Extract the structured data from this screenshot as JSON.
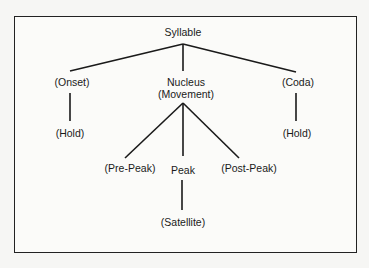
{
  "diagram": {
    "type": "tree",
    "root": "Syllable",
    "nodes": {
      "syllable": "Syllable",
      "onset": "(Onset)",
      "onset_hold": "(Hold)",
      "nucleus_line1": "Nucleus",
      "nucleus_line2": "(Movement)",
      "coda": "(Coda)",
      "coda_hold": "(Hold)",
      "pre_peak": "(Pre-Peak)",
      "peak": "Peak",
      "post_peak": "(Post-Peak)",
      "satellite": "(Satellite)"
    },
    "edges": [
      [
        "Syllable",
        "(Onset)"
      ],
      [
        "Syllable",
        "Nucleus (Movement)"
      ],
      [
        "Syllable",
        "(Coda)"
      ],
      [
        "(Onset)",
        "(Hold)"
      ],
      [
        "(Coda)",
        "(Hold)"
      ],
      [
        "Nucleus (Movement)",
        "(Pre-Peak)"
      ],
      [
        "Nucleus (Movement)",
        "Peak"
      ],
      [
        "Nucleus (Movement)",
        "(Post-Peak)"
      ],
      [
        "Peak",
        "(Satellite)"
      ]
    ],
    "line_color": "#1a1a1a"
  }
}
